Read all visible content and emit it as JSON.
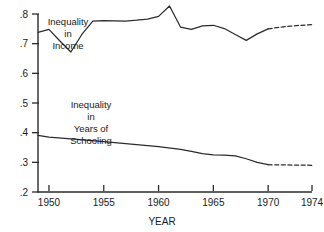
{
  "chart_data": {
    "type": "line",
    "title": "",
    "xlabel": "YEAR",
    "ylabel": "",
    "xlim": [
      1949,
      1974
    ],
    "ylim": [
      0.2,
      0.8
    ],
    "grid": false,
    "legend": "inline-annotations",
    "xticks": [
      1950,
      1955,
      1960,
      1965,
      1970,
      1974
    ],
    "xtick_labels": [
      "1950",
      "1955",
      "1960",
      "1965",
      "1970",
      "1974"
    ],
    "yticks": [
      0.2,
      0.3,
      0.4,
      0.5,
      0.6,
      0.7,
      0.8
    ],
    "ytick_labels": [
      ".2",
      ".3",
      ".4",
      ".5",
      ".6",
      ".7",
      ".8"
    ],
    "annotations": [
      {
        "name": "income-series-label",
        "lines": [
          "Inequality",
          "in",
          "Income"
        ]
      },
      {
        "name": "schooling-series-label",
        "lines": [
          "Inequality",
          "in",
          "Years of",
          "Schooling"
        ]
      }
    ],
    "series": [
      {
        "name": "Inequality in Income",
        "x": [
          1949,
          1950,
          1951,
          1952,
          1953,
          1954,
          1955,
          1956,
          1957,
          1958,
          1959,
          1960,
          1961,
          1962,
          1963,
          1964,
          1965,
          1966,
          1967,
          1968,
          1969,
          1970
        ],
        "values": [
          0.738,
          0.748,
          0.709,
          0.672,
          0.731,
          0.776,
          0.778,
          0.777,
          0.776,
          0.779,
          0.783,
          0.792,
          0.827,
          0.756,
          0.748,
          0.76,
          0.762,
          0.751,
          0.731,
          0.711,
          0.733,
          0.75
        ],
        "projected_x": [
          1970,
          1971,
          1972,
          1973,
          1974
        ],
        "projected_values": [
          0.75,
          0.755,
          0.759,
          0.762,
          0.764
        ],
        "style": "solid",
        "projection_style": "dashed"
      },
      {
        "name": "Inequality in Years of Schooling",
        "x": [
          1949,
          1950,
          1952,
          1955,
          1958,
          1960,
          1962,
          1963,
          1964,
          1965,
          1966,
          1967,
          1968,
          1969,
          1970
        ],
        "values": [
          0.391,
          0.385,
          0.379,
          0.37,
          0.36,
          0.353,
          0.344,
          0.337,
          0.329,
          0.325,
          0.324,
          0.322,
          0.312,
          0.3,
          0.292
        ],
        "projected_x": [
          1970,
          1974
        ],
        "projected_values": [
          0.292,
          0.29
        ],
        "style": "solid",
        "projection_style": "dashed"
      }
    ]
  },
  "colors": {
    "background": "#ffffff",
    "line": "#2b2b2b",
    "text": "#1a1a1a"
  }
}
